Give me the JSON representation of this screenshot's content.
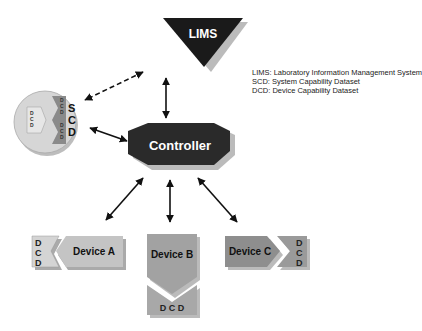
{
  "diagram": {
    "nodes": {
      "lims": {
        "label": "LIMS",
        "shape": "inverted-triangle",
        "color": "#1a1a1a"
      },
      "controller": {
        "label": "Controller",
        "shape": "octagon",
        "color": "#2a2a2a"
      },
      "scd": {
        "label_letters": [
          "S",
          "C",
          "D"
        ],
        "inner_dcd_letters": [
          "D",
          "C",
          "D"
        ],
        "shape": "circle",
        "color": "#d0d0d0"
      },
      "device_a": {
        "label": "Device A",
        "dcd_letters": [
          "D",
          "C",
          "D"
        ],
        "color": "#c8c8c8"
      },
      "device_b": {
        "label": "Device B",
        "dcd_label": "D C D",
        "color": "#a0a0a0"
      },
      "device_c": {
        "label": "Device C",
        "dcd_letters": [
          "D",
          "C",
          "D"
        ],
        "color": "#8c8c8c"
      }
    },
    "legend": [
      "LIMS: Laboratory Information Management System",
      "SCD:  System Capability Dataset",
      "DCD:  Device Capability Dataset"
    ],
    "edges": [
      {
        "from": "lims",
        "to": "scd",
        "style": "dashed",
        "direction": "both"
      },
      {
        "from": "lims",
        "to": "controller",
        "style": "solid",
        "direction": "both"
      },
      {
        "from": "scd",
        "to": "controller",
        "style": "solid",
        "direction": "both"
      },
      {
        "from": "controller",
        "to": "device_a",
        "style": "solid",
        "direction": "both"
      },
      {
        "from": "controller",
        "to": "device_b",
        "style": "solid",
        "direction": "both"
      },
      {
        "from": "controller",
        "to": "device_c",
        "style": "solid",
        "direction": "both"
      }
    ]
  }
}
